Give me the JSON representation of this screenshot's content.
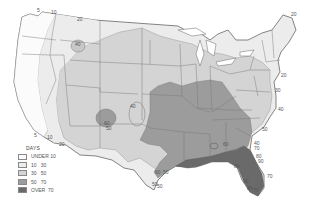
{
  "map": {
    "title": "Annual thunderstorm days, contiguous United States",
    "colors": {
      "under10": "#fbfbfb",
      "10_30": "#ececec",
      "30_50": "#d4d4d4",
      "50_70": "#9c9c9c",
      "over70": "#6a6a6a",
      "border": "#666666"
    },
    "contour_labels": [
      {
        "text": "5",
        "x": 37,
        "y": 12
      },
      {
        "text": "10",
        "x": 51,
        "y": 14
      },
      {
        "text": "20",
        "x": 77,
        "y": 21
      },
      {
        "text": "40",
        "x": 75,
        "y": 46
      },
      {
        "text": "20",
        "x": 291,
        "y": 16
      },
      {
        "text": "20",
        "x": 281,
        "y": 77
      },
      {
        "text": "30",
        "x": 275,
        "y": 92
      },
      {
        "text": "40",
        "x": 278,
        "y": 111
      },
      {
        "text": "50",
        "x": 262,
        "y": 131
      },
      {
        "text": "60",
        "x": 223,
        "y": 146
      },
      {
        "text": "40",
        "x": 254,
        "y": 145
      },
      {
        "text": "70",
        "x": 254,
        "y": 150
      },
      {
        "text": "80",
        "x": 256,
        "y": 158
      },
      {
        "text": "90",
        "x": 258,
        "y": 163
      },
      {
        "text": "80",
        "x": 234,
        "y": 168
      },
      {
        "text": "70",
        "x": 267,
        "y": 178
      },
      {
        "text": "90",
        "x": 243,
        "y": 183
      },
      {
        "text": "80",
        "x": 247,
        "y": 190
      },
      {
        "text": "70",
        "x": 253,
        "y": 192
      },
      {
        "text": "40",
        "x": 130,
        "y": 108
      },
      {
        "text": "60",
        "x": 104,
        "y": 125
      },
      {
        "text": "50",
        "x": 106,
        "y": 130
      },
      {
        "text": "60",
        "x": 155,
        "y": 174
      },
      {
        "text": "50",
        "x": 163,
        "y": 174
      },
      {
        "text": "50",
        "x": 152,
        "y": 186
      },
      {
        "text": "50",
        "x": 157,
        "y": 188
      },
      {
        "text": "5",
        "x": 34,
        "y": 137
      },
      {
        "text": "10",
        "x": 47,
        "y": 139
      },
      {
        "text": "20",
        "x": 59,
        "y": 146
      }
    ]
  },
  "legend": {
    "title": "DAYS",
    "items": [
      {
        "label": "UNDER 10",
        "color": "#fbfbfb"
      },
      {
        "label": "10   30",
        "color": "#ececec"
      },
      {
        "label": "30   50",
        "color": "#d4d4d4"
      },
      {
        "label": "50   70",
        "color": "#9c9c9c"
      },
      {
        "label": "OVER  70",
        "color": "#6a6a6a"
      }
    ]
  }
}
